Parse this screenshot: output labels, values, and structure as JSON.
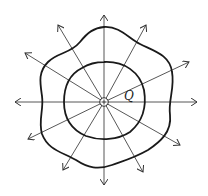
{
  "diagram": {
    "type": "electric-field-lines-with-equipotential-surfaces",
    "charge": {
      "label": "Q",
      "sign": "+",
      "center": [
        104,
        102
      ]
    },
    "field_lines": {
      "count": 12,
      "direction": "outward",
      "tips": [
        [
          104,
          15
        ],
        [
          146,
          25
        ],
        [
          189,
          62
        ],
        [
          197,
          102
        ],
        [
          180,
          145
        ],
        [
          143,
          172
        ],
        [
          104,
          185
        ],
        [
          63,
          170
        ],
        [
          28,
          139
        ],
        [
          15,
          102
        ],
        [
          25,
          53
        ],
        [
          58,
          25
        ]
      ]
    },
    "equipotentials": [
      {
        "name": "inner",
        "shape": "near-circular",
        "radius": 40
      },
      {
        "name": "outer",
        "shape": "wavy-hexagonal",
        "radius": 70
      }
    ],
    "colors": {
      "line": "#333333",
      "curve": "#1a1a1a",
      "background": "#ffffff"
    }
  }
}
